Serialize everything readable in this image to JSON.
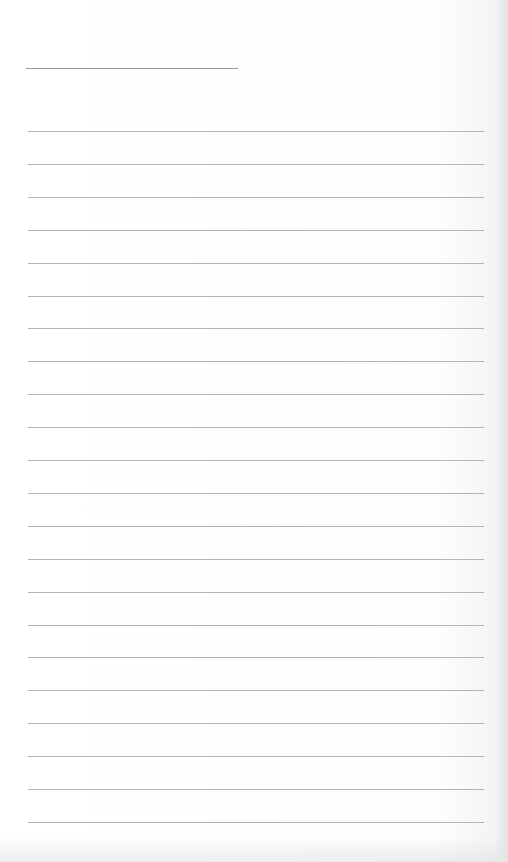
{
  "page": {
    "type": "lined-paper",
    "title_line": {
      "present": true
    },
    "rules": {
      "count": 22,
      "first_y": 131,
      "spacing": 32.9
    },
    "text": []
  },
  "colors": {
    "paper": "#fdfdfd",
    "rule": "#a8a8a8",
    "title_line": "#9a9a9a"
  }
}
